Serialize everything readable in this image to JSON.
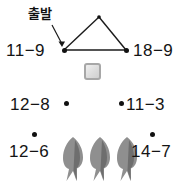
{
  "page": {
    "background_color": "#ffffff",
    "width": 187,
    "height": 184,
    "kind": "math-worksheet-route-diagram"
  },
  "annotations": {
    "start_label": "출발",
    "start_label_meaning": "departure / start",
    "pointer": "arrow-from-start-label-to-left-vertex"
  },
  "diagram": {
    "shape": "triangle-route",
    "stroke_color": "#1a1a1a",
    "node_color": "#111111",
    "vertices": [
      {
        "name": "left-vertex",
        "x": 64,
        "y": 50
      },
      {
        "name": "apex-vertex",
        "x": 99,
        "y": 17
      },
      {
        "name": "right-vertex",
        "x": 126,
        "y": 50
      }
    ],
    "edges": [
      {
        "from": "left-vertex",
        "to": "apex-vertex"
      },
      {
        "from": "apex-vertex",
        "to": "right-vertex"
      },
      {
        "from": "left-vertex",
        "to": "right-vertex"
      }
    ]
  },
  "icons": {
    "grey_square": {
      "name": "grey-rounded-square",
      "border_color": "#a7a7a7",
      "fill_color": "#dcdcdc"
    },
    "trees": {
      "name": "grey-tree",
      "count": 3,
      "fill_color": "#8f8f8f",
      "shadow_color": "#6b6b6b"
    }
  },
  "expressions": [
    {
      "id": "expr-11-9",
      "minuend": "11",
      "operator": "−",
      "subtrahend": "9",
      "text": "11−9",
      "dot_position": "right",
      "row": 1,
      "side": "left"
    },
    {
      "id": "expr-18-9",
      "minuend": "18",
      "operator": "−",
      "subtrahend": "9",
      "text": "18−9",
      "dot_position": "left",
      "row": 1,
      "side": "right"
    },
    {
      "id": "expr-12-8",
      "minuend": "12",
      "operator": "−",
      "subtrahend": "8",
      "text": "12−8",
      "dot_position": "right",
      "row": 2,
      "side": "left"
    },
    {
      "id": "expr-11-3",
      "minuend": "11",
      "operator": "−",
      "subtrahend": "3",
      "text": "11−3",
      "dot_position": "left",
      "row": 2,
      "side": "right"
    },
    {
      "id": "expr-12-6",
      "minuend": "12",
      "operator": "−",
      "subtrahend": "6",
      "text": "12−6",
      "dot_position": "above",
      "row": 3,
      "side": "left"
    },
    {
      "id": "expr-14-7",
      "minuend": "14",
      "operator": "−",
      "subtrahend": "7",
      "text": "14−7",
      "dot_position": "above",
      "row": 3,
      "side": "right"
    }
  ]
}
